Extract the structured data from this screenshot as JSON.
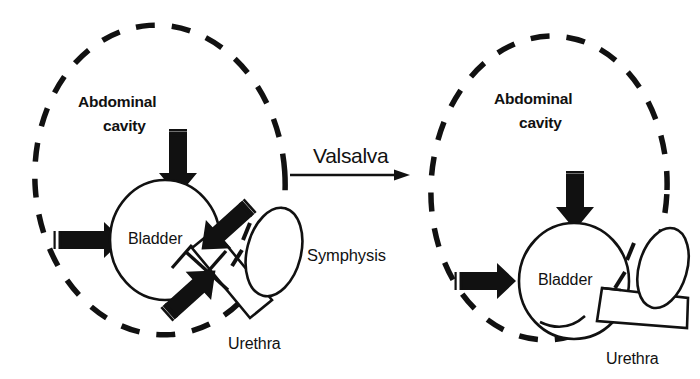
{
  "figure": {
    "background_color": "#ffffff",
    "ink_color": "#111111"
  },
  "transition": {
    "label": "Valsalva",
    "arrow_icon": "arrow-right-icon",
    "underline": true
  },
  "panels": [
    {
      "id": "before",
      "position": "left",
      "cavity_label_line1": "Abdominal",
      "cavity_label_line2": "cavity",
      "bladder_label": "Bladder",
      "urethra_label": "Urethra",
      "symphysis_label": "Symphysis",
      "urethra_state": "closed-oblique",
      "arrows": [
        {
          "name": "pressure-arrow-down",
          "direction": "down"
        },
        {
          "name": "pressure-arrow-right",
          "direction": "right"
        },
        {
          "name": "pressure-arrow-down-left",
          "direction": "down-left"
        },
        {
          "name": "pressure-arrow-up-right",
          "direction": "up-right"
        }
      ]
    },
    {
      "id": "after",
      "position": "right",
      "cavity_label_line1": "Abdominal",
      "cavity_label_line2": "cavity",
      "bladder_label": "Bladder",
      "urethra_label": "Urethra",
      "symphysis_label": "",
      "urethra_state": "descended-open",
      "arrows": [
        {
          "name": "pressure-arrow-down",
          "direction": "down"
        },
        {
          "name": "pressure-arrow-right",
          "direction": "right"
        }
      ]
    }
  ]
}
